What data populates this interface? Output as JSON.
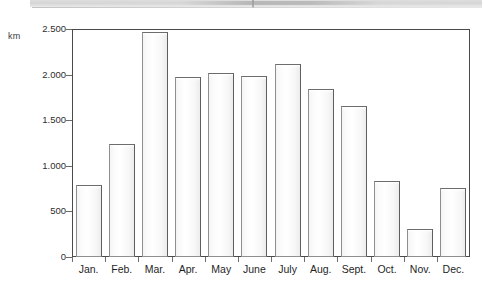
{
  "chart_data": {
    "type": "bar",
    "title": "",
    "xlabel": "",
    "ylabel": "km",
    "ylim": [
      0,
      2500
    ],
    "grid": true,
    "legend": "none",
    "categories": [
      "Jan.",
      "Feb.",
      "Mar.",
      "Apr.",
      "May",
      "June",
      "July",
      "Aug.",
      "Sept.",
      "Oct.",
      "Nov.",
      "Dec."
    ],
    "values": [
      790,
      1240,
      2470,
      1975,
      2015,
      1985,
      2115,
      1845,
      1655,
      835,
      310,
      760
    ],
    "ytick_labels": [
      "0",
      "500",
      "1.000",
      "1.500",
      "2.000",
      "2.500"
    ],
    "ytick_values": [
      0,
      500,
      1000,
      1500,
      2000,
      2500
    ],
    "series": [
      {
        "name": "km",
        "values": [
          790,
          1240,
          2470,
          1975,
          2015,
          1985,
          2115,
          1845,
          1655,
          835,
          310,
          760
        ]
      }
    ],
    "colors": {
      "bar_fill": "#fbfbfb",
      "bar_border": "#8f8f8f",
      "gridline": "#c8c8c8",
      "axis": "#4a4a4a",
      "text": "#1f1f1f"
    }
  },
  "axis": {
    "unit_label": "km"
  },
  "ticks": [
    {
      "label": "2.500"
    },
    {
      "label": "2.000"
    },
    {
      "label": "1.500"
    },
    {
      "label": "1.000"
    },
    {
      "label": "500"
    },
    {
      "label": "0"
    }
  ],
  "months": [
    {
      "label": "Jan."
    },
    {
      "label": "Feb."
    },
    {
      "label": "Mar."
    },
    {
      "label": "Apr."
    },
    {
      "label": "May"
    },
    {
      "label": "June"
    },
    {
      "label": "July"
    },
    {
      "label": "Aug."
    },
    {
      "label": "Sept."
    },
    {
      "label": "Oct."
    },
    {
      "label": "Nov."
    },
    {
      "label": "Dec."
    }
  ]
}
